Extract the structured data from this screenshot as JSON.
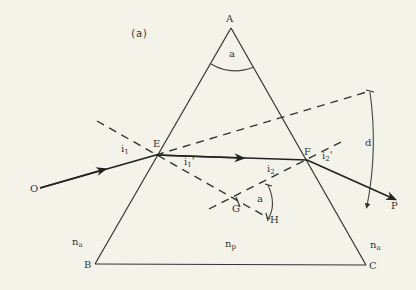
{
  "figure_label": "(a)",
  "points": {
    "A": "A",
    "B": "B",
    "C": "C",
    "E": "E",
    "F": "F",
    "G": "G",
    "H": "H",
    "O": "O",
    "P": "P"
  },
  "angles": {
    "apex": "a",
    "gh": "a",
    "deviation": "d",
    "i1": {
      "base": "i",
      "sub": "1",
      "prime": ""
    },
    "i1p": {
      "base": "i",
      "sub": "1",
      "prime": "'"
    },
    "i2": {
      "base": "i",
      "sub": "2",
      "prime": ""
    },
    "i2p": {
      "base": "i",
      "sub": "2",
      "prime": "'"
    }
  },
  "media": {
    "left": {
      "base": "n",
      "sub": "a"
    },
    "prism": {
      "base": "n",
      "sub": "p"
    },
    "right": {
      "base": "n",
      "sub": "a"
    }
  }
}
